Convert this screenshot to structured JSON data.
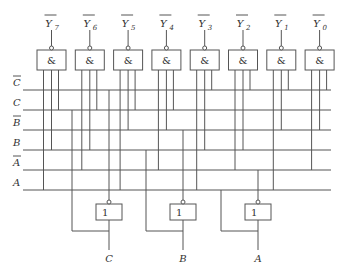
{
  "caption_fragment": "",
  "outputs": [
    {
      "name": "Y",
      "sub": "7",
      "symbol": "&",
      "inputs": [
        "A",
        "B",
        "C"
      ]
    },
    {
      "name": "Y",
      "sub": "6",
      "symbol": "&",
      "inputs": [
        "A_bar",
        "B",
        "C"
      ]
    },
    {
      "name": "Y",
      "sub": "5",
      "symbol": "&",
      "inputs": [
        "A",
        "B_bar",
        "C"
      ]
    },
    {
      "name": "Y",
      "sub": "4",
      "symbol": "&",
      "inputs": [
        "A_bar",
        "B_bar",
        "C"
      ]
    },
    {
      "name": "Y",
      "sub": "3",
      "symbol": "&",
      "inputs": [
        "A",
        "B",
        "C_bar"
      ]
    },
    {
      "name": "Y",
      "sub": "2",
      "symbol": "&",
      "inputs": [
        "A_bar",
        "B",
        "C_bar"
      ]
    },
    {
      "name": "Y",
      "sub": "1",
      "symbol": "&",
      "inputs": [
        "A",
        "B_bar",
        "C_bar"
      ]
    },
    {
      "name": "Y",
      "sub": "0",
      "symbol": "&",
      "inputs": [
        "A_bar",
        "B_bar",
        "C_bar"
      ]
    }
  ],
  "bus": [
    {
      "id": "C_bar",
      "label": "C",
      "inverted": true
    },
    {
      "id": "C",
      "label": "C",
      "inverted": false
    },
    {
      "id": "B_bar",
      "label": "B",
      "inverted": true
    },
    {
      "id": "B",
      "label": "B",
      "inverted": false
    },
    {
      "id": "A_bar",
      "label": "A",
      "inverted": true
    },
    {
      "id": "A",
      "label": "A",
      "inverted": false
    }
  ],
  "inverters": [
    {
      "input": "C",
      "symbol": "1",
      "drives": "C_bar"
    },
    {
      "input": "B",
      "symbol": "1",
      "drives": "B_bar"
    },
    {
      "input": "A",
      "symbol": "1",
      "drives": "A_bar"
    }
  ]
}
